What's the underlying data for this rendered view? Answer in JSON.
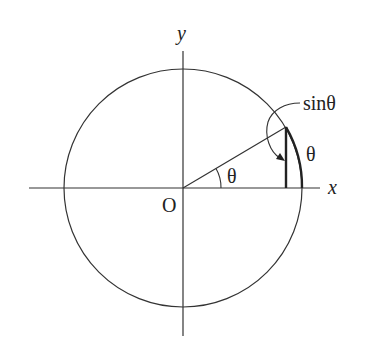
{
  "diagram": {
    "labels": {
      "y_axis": "y",
      "x_axis": "x",
      "origin": "O",
      "angle": "θ",
      "arc": "θ",
      "sine": "sinθ"
    },
    "geometry": {
      "center": [
        183,
        188
      ],
      "radius": 120,
      "angle_deg": 30.6
    },
    "colors": {
      "stroke": "#333333",
      "text": "#222222",
      "background": "#ffffff"
    }
  }
}
